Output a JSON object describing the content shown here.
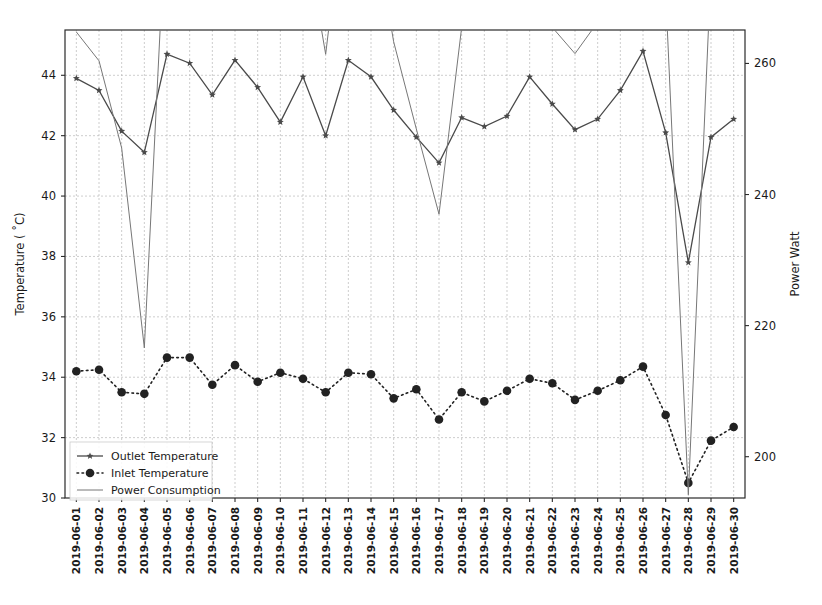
{
  "chart_data": {
    "type": "line",
    "title": "",
    "xlabel": "",
    "ylabel": "Temperature ( ˚C)",
    "y2label": "Power Watt",
    "grid": true,
    "legend_position": "lower-left",
    "ylim": [
      30,
      45.5
    ],
    "y2lim": [
      193.7,
      265.1
    ],
    "yticks": [
      30,
      32,
      34,
      36,
      38,
      40,
      42,
      44
    ],
    "y2ticks": [
      200,
      220,
      240,
      260,
      280
    ],
    "categories": [
      "2019-06-01",
      "2019-06-02",
      "2019-06-03",
      "2019-06-04",
      "2019-06-05",
      "2019-06-06",
      "2019-06-07",
      "2019-06-08",
      "2019-06-09",
      "2019-06-10",
      "2019-06-11",
      "2019-06-12",
      "2019-06-13",
      "2019-06-14",
      "2019-06-15",
      "2019-06-16",
      "2019-06-17",
      "2019-06-18",
      "2019-06-19",
      "2019-06-20",
      "2019-06-21",
      "2019-06-22",
      "2019-06-23",
      "2019-06-24",
      "2019-06-25",
      "2019-06-26",
      "2019-06-27",
      "2019-06-28",
      "2019-06-29",
      "2019-06-30"
    ],
    "series": [
      {
        "name": "Outlet Temperature",
        "axis": "left",
        "unit": "°C",
        "color": "#4a4a4a",
        "linestyle": "solid",
        "marker": "star",
        "values": [
          43.9,
          43.5,
          42.15,
          41.45,
          44.7,
          44.4,
          43.35,
          44.5,
          43.6,
          42.45,
          43.95,
          42.0,
          44.5,
          43.95,
          42.85,
          41.95,
          41.1,
          42.6,
          42.3,
          42.65,
          43.95,
          43.05,
          42.2,
          42.55,
          43.5,
          44.8,
          42.1,
          37.8,
          41.95,
          42.55
        ]
      },
      {
        "name": "Inlet Temperature",
        "axis": "left",
        "unit": "°C",
        "color": "#222222",
        "linestyle": "dotted",
        "marker": "circle",
        "values": [
          34.2,
          34.25,
          33.5,
          33.45,
          34.65,
          34.65,
          33.75,
          34.4,
          33.85,
          34.15,
          33.95,
          33.5,
          34.15,
          34.1,
          33.3,
          33.6,
          32.6,
          33.5,
          33.2,
          33.55,
          33.95,
          33.8,
          33.25,
          33.55,
          33.9,
          34.35,
          32.75,
          30.5,
          31.9,
          32.35
        ]
      },
      {
        "name": "Power Consumption",
        "axis": "right",
        "unit": "W",
        "color": "#777777",
        "linestyle": "solid",
        "marker": "none",
        "values": [
          264.8,
          260.4,
          247.1,
          216.6,
          286.3,
          284.4,
          276.0,
          283.9,
          277.8,
          272.3,
          281.8,
          261.4,
          290.2,
          283.9,
          263.3,
          250.0,
          237.0,
          265.5,
          269.1,
          271.2,
          281.1,
          265.5,
          261.5,
          266.3,
          276.9,
          285.6,
          270.8,
          194.2,
          274.3,
          276.5
        ]
      }
    ]
  },
  "legend": {
    "entries": [
      {
        "label": "Outlet Temperature"
      },
      {
        "label": "Inlet Temperature"
      },
      {
        "label": "Power Consumption"
      }
    ]
  }
}
